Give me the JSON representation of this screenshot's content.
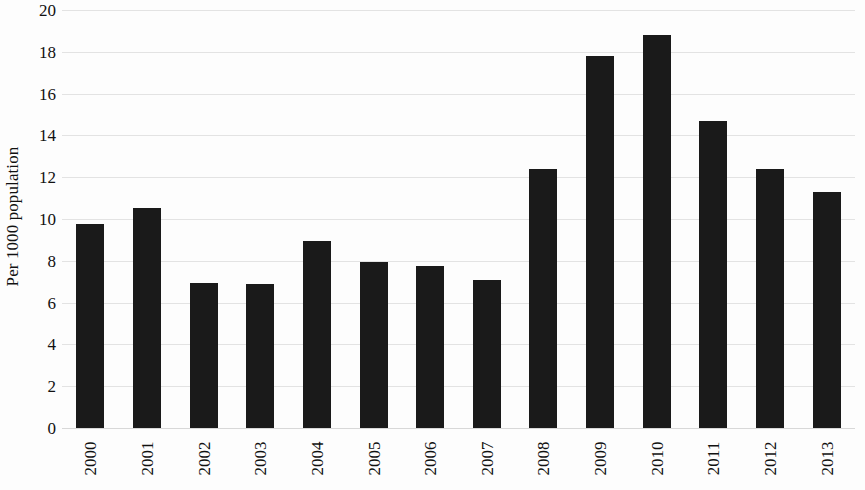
{
  "chart_data": {
    "type": "bar",
    "title": "",
    "subtitle": "",
    "xlabel": "",
    "ylabel": "Per 1000 population",
    "categories": [
      "2000",
      "2001",
      "2002",
      "2003",
      "2004",
      "2005",
      "2006",
      "2007",
      "2008",
      "2009",
      "2010",
      "2011",
      "2012",
      "2013"
    ],
    "values": [
      9.75,
      10.55,
      6.95,
      6.9,
      8.95,
      7.95,
      7.75,
      7.1,
      12.4,
      17.8,
      18.8,
      14.7,
      12.4,
      11.3
    ],
    "ylim": [
      0,
      20
    ],
    "ytick_step": 2,
    "yticks": [
      "20",
      "18",
      "16",
      "14",
      "12",
      "10",
      "8",
      "6",
      "4",
      "2",
      "0"
    ],
    "ytick_values": [
      20,
      18,
      16,
      14,
      12,
      10,
      8,
      6,
      4,
      2,
      0
    ],
    "grid": true,
    "grid_axis": "y",
    "legend": false,
    "legend_position": "none",
    "xtick_rotation": -90,
    "bar_color": "#1a1a1a",
    "grid_color": "#e3e3e3",
    "background_color": "#fdfdfd",
    "text_color": "#111111"
  }
}
